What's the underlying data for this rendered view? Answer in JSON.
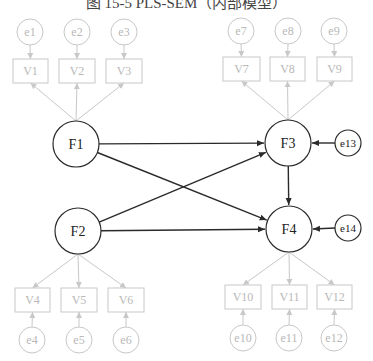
{
  "title": "图 15-5  PLS-SEM（内部模型）",
  "latent": [
    {
      "id": "F1",
      "label": "F1",
      "cx": 76,
      "cy": 144,
      "r": 23
    },
    {
      "id": "F2",
      "label": "F2",
      "cx": 78,
      "cy": 231,
      "r": 23
    },
    {
      "id": "F3",
      "label": "F3",
      "cx": 288,
      "cy": 143,
      "r": 23
    },
    {
      "id": "F4",
      "label": "F4",
      "cx": 289,
      "cy": 229,
      "r": 23
    }
  ],
  "structural_errors": [
    {
      "id": "e13",
      "label": "e13",
      "cx": 348,
      "cy": 143,
      "r": 13,
      "target": "F3"
    },
    {
      "id": "e14",
      "label": "e14",
      "cx": 348,
      "cy": 228,
      "r": 13,
      "target": "F4"
    }
  ],
  "indicators": [
    {
      "id": "V1",
      "label": "V1",
      "x": 13,
      "y": 59,
      "w": 35,
      "h": 24,
      "factor": "F1",
      "error": {
        "label": "e1",
        "cx": 30,
        "cy": 32
      }
    },
    {
      "id": "V2",
      "label": "V2",
      "x": 59,
      "y": 59,
      "w": 36,
      "h": 24,
      "factor": "F1",
      "error": {
        "label": "e2",
        "cx": 77,
        "cy": 32
      }
    },
    {
      "id": "V3",
      "label": "V3",
      "x": 106,
      "y": 59,
      "w": 36,
      "h": 24,
      "factor": "F1",
      "error": {
        "label": "e3",
        "cx": 124,
        "cy": 32
      }
    },
    {
      "id": "V4",
      "label": "V4",
      "x": 15,
      "y": 288,
      "w": 35,
      "h": 24,
      "factor": "F2",
      "error": {
        "label": "e4",
        "cx": 32,
        "cy": 340
      }
    },
    {
      "id": "V5",
      "label": "V5",
      "x": 61,
      "y": 288,
      "w": 36,
      "h": 24,
      "factor": "F2",
      "error": {
        "label": "e5",
        "cx": 79,
        "cy": 340
      }
    },
    {
      "id": "V6",
      "label": "V6",
      "x": 108,
      "y": 288,
      "w": 36,
      "h": 24,
      "factor": "F2",
      "error": {
        "label": "e6",
        "cx": 126,
        "cy": 340
      }
    },
    {
      "id": "V7",
      "label": "V7",
      "x": 223,
      "y": 57,
      "w": 37,
      "h": 24,
      "factor": "F3",
      "error": {
        "label": "e7",
        "cx": 241,
        "cy": 31
      }
    },
    {
      "id": "V8",
      "label": "V8",
      "x": 270,
      "y": 57,
      "w": 35,
      "h": 24,
      "factor": "F3",
      "error": {
        "label": "e8",
        "cx": 288,
        "cy": 31
      }
    },
    {
      "id": "V9",
      "label": "V9",
      "x": 317,
      "y": 57,
      "w": 35,
      "h": 24,
      "factor": "F3",
      "error": {
        "label": "e9",
        "cx": 334,
        "cy": 31
      }
    },
    {
      "id": "V10",
      "label": "V10",
      "x": 225,
      "y": 285,
      "w": 36,
      "h": 24,
      "factor": "F4",
      "error": {
        "label": "e10",
        "cx": 243,
        "cy": 338
      }
    },
    {
      "id": "V11",
      "label": "V11",
      "x": 272,
      "y": 285,
      "w": 35,
      "h": 24,
      "factor": "F4",
      "error": {
        "label": "e11",
        "cx": 289,
        "cy": 338
      }
    },
    {
      "id": "V12",
      "label": "V12",
      "x": 317,
      "y": 285,
      "w": 35,
      "h": 24,
      "factor": "F4",
      "error": {
        "label": "e12",
        "cx": 334,
        "cy": 338
      }
    }
  ],
  "paths": [
    {
      "from": "F1",
      "to": "F3"
    },
    {
      "from": "F1",
      "to": "F4"
    },
    {
      "from": "F2",
      "to": "F3"
    },
    {
      "from": "F2",
      "to": "F4"
    },
    {
      "from": "F3",
      "to": "F4"
    }
  ],
  "colors": {
    "measurement": "#c8c8c8",
    "structural": "#2a2a2a",
    "background": "#ffffff"
  }
}
